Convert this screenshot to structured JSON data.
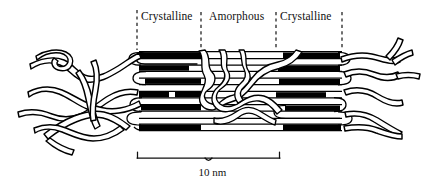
{
  "figure": {
    "background_color": "#ffffff",
    "ink_color": "#000000",
    "width": 427,
    "height": 187
  },
  "labels": {
    "crystalline_left": "Crystalline",
    "amorphous": "Amorphous",
    "crystalline_right": "Crystalline"
  },
  "scale_bar": {
    "value": "10 nm",
    "x_start": 137,
    "x_end": 280,
    "y": 158
  },
  "boundaries": {
    "style": "dashed",
    "x_positions": [
      137,
      201,
      276,
      342
    ],
    "y_top": 10,
    "y_bottom": 50
  },
  "regions": [
    {
      "name": "crystalline_left",
      "label": "Crystalline",
      "x_start": 137,
      "x_end": 201
    },
    {
      "name": "amorphous_middle",
      "label": "Amorphous",
      "x_start": 201,
      "x_end": 276
    },
    {
      "name": "crystalline_right",
      "label": "Crystalline",
      "x_start": 276,
      "x_end": 342
    }
  ]
}
